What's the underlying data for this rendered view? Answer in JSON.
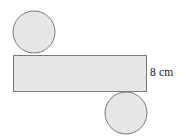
{
  "figure": {
    "background_color": "#ffffff",
    "shape_fill_color": "#e6e6e6",
    "shape_stroke_color": "#7a7a7a",
    "label_color": "#1a1a1a",
    "rectangle": {
      "name": "lateral-face-rectangle",
      "x": 13,
      "y": 55,
      "width": 134,
      "height": 37
    },
    "top_circle": {
      "name": "top-base-circle",
      "cx": 34,
      "cy": 32,
      "r": 21
    },
    "bottom_circle": {
      "name": "bottom-base-circle",
      "cx": 126,
      "cy": 113,
      "r": 21
    },
    "dimension_label": {
      "name": "height-dimension-label",
      "text": "8 cm",
      "value": 8,
      "unit": "cm",
      "applies_to": "rectangle-height"
    }
  }
}
